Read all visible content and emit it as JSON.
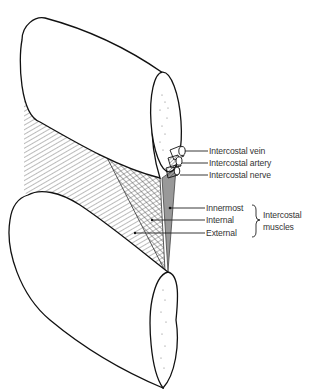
{
  "diagram": {
    "labels": {
      "vein": "Intercostal vein",
      "artery": "Intercostal artery",
      "nerve": "Intercostal nerve",
      "innermost": "Innermost",
      "internal": "Internal",
      "external": "External",
      "group_line1": "Intercostal",
      "group_line2": "muscles"
    }
  }
}
